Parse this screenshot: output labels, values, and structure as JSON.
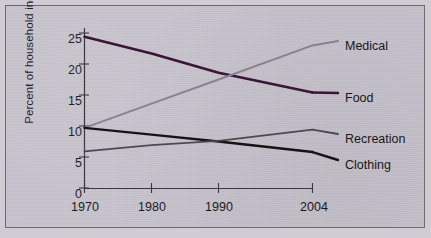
{
  "chart_data": {
    "type": "line",
    "title": "",
    "subtitle": "",
    "xlabel": "",
    "ylabel": "Percent of household income",
    "x": [
      1970,
      1980,
      1990,
      2004
    ],
    "xtick_labels": [
      "1970",
      "1980",
      "1990",
      "2004"
    ],
    "xlim": [
      1970,
      2004
    ],
    "ylim": [
      0,
      25
    ],
    "ytick_labels": [
      "0",
      "5",
      "10",
      "15",
      "20",
      "25"
    ],
    "yticks": [
      0,
      5,
      10,
      15,
      20,
      25
    ],
    "grid": false,
    "legend_position": "right-inline-labels",
    "series": [
      {
        "name": "Food",
        "label": "Food",
        "color": "#3c1338",
        "width": 2.6,
        "values": [
          24.4,
          21.7,
          18.6,
          15.4
        ]
      },
      {
        "name": "Medical",
        "label": "Medical",
        "color": "#8d8194",
        "width": 2.0,
        "values": [
          9.7,
          13.6,
          17.5,
          23.0
        ]
      },
      {
        "name": "Clothing",
        "label": "Clothing",
        "color": "#131215",
        "width": 2.4,
        "values": [
          9.7,
          8.6,
          7.5,
          5.8
        ]
      },
      {
        "name": "Recreation",
        "label": "Recreation",
        "color": "#4c4950",
        "width": 1.8,
        "values": [
          5.9,
          6.9,
          7.6,
          9.4
        ]
      }
    ],
    "annotations": [
      "Food and Medical lines cross at about 17.5 percent just after 1990",
      "Clothing and Recreation lines cross at about 7.6 percent near 1986"
    ]
  },
  "colors": {
    "background": "#c8c4cd",
    "paper": "#cfccd4",
    "frame_border": "#6d6a72",
    "axis": "#39373d",
    "text": "#17161a"
  }
}
